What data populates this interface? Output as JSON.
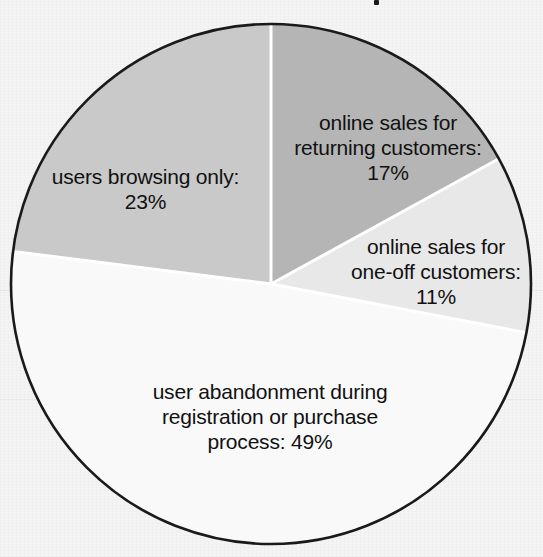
{
  "chart_data": {
    "type": "pie",
    "title": "",
    "categories": [
      "users browsing only",
      "online sales for returning customers",
      "online sales for one-off customers",
      "user abandonment during registration or purchase process"
    ],
    "values": [
      23,
      17,
      11,
      49
    ],
    "value_unit": "%",
    "total": 100,
    "legend": "none",
    "grid": false,
    "start_angle_deg": 0,
    "start_position": "12 o'clock",
    "slices": [
      {
        "label": "users browsing only:\n23%",
        "name": "users browsing only",
        "value": 23,
        "value_text": "23%",
        "color": "#c9c9c9",
        "direction": "counter-clockwise from 12 o'clock",
        "label_position": "inside-left"
      },
      {
        "label": "online sales for\nreturning customers:\n17%",
        "name": "online sales for returning customers",
        "value": 17,
        "value_text": "17%",
        "color": "#b5b5b5",
        "direction": "clockwise from 12 o'clock",
        "label_position": "inside-upper-right"
      },
      {
        "label": "online sales for\none-off customers:\n11%",
        "name": "online sales for one-off customers",
        "value": 11,
        "value_text": "11%",
        "color": "#e8e8e8",
        "direction": "clockwise",
        "label_position": "inside-right"
      },
      {
        "label": "user abandonment during\nregistration or purchase\nprocess: 49%",
        "name": "user abandonment during registration or purchase process",
        "value": 49,
        "value_text": "49%",
        "color": "#f9f9f9",
        "direction": "clockwise",
        "label_position": "inside-bottom"
      }
    ],
    "style": {
      "background": "#f4f4f4",
      "outline_color": "#1a1a1a",
      "separator_color": "#ffffff",
      "label_color": "#111111"
    }
  }
}
